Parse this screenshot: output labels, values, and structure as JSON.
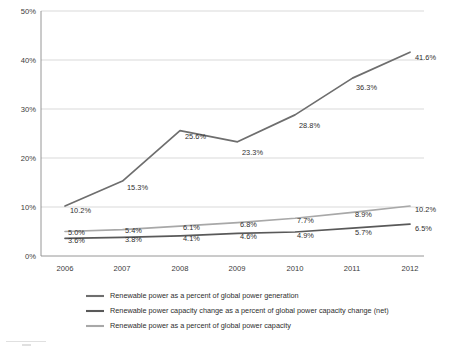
{
  "chart_data": {
    "type": "line",
    "title": "",
    "subtitle": "",
    "xlabel": "",
    "ylabel": "",
    "categories": [
      "2006",
      "2007",
      "2008",
      "2009",
      "2010",
      "2011",
      "2012"
    ],
    "ylim": [
      0,
      50
    ],
    "yticks": [
      0,
      10,
      20,
      30,
      40,
      50
    ],
    "ytick_labels": [
      "0%",
      "10%",
      "20%",
      "30%",
      "40%",
      "50%"
    ],
    "grid": true,
    "grid_axis": "y",
    "legend_position": "bottom",
    "series": [
      {
        "name": "Renewable power as a percent of global power generation",
        "key": "generation",
        "color": "#6e6e6e",
        "values": [
          10.2,
          15.3,
          25.6,
          23.3,
          28.8,
          36.3,
          41.6
        ],
        "labels": [
          "10.2%",
          "15.3%",
          "25.6%",
          "23.3%",
          "28.8%",
          "36.3%",
          "41.6%"
        ]
      },
      {
        "name": "Renewable power capacity change as a percent of global power capacity change (net)",
        "key": "capacity_change_net",
        "color": "#595959",
        "values": [
          3.6,
          3.8,
          4.1,
          4.6,
          4.9,
          5.7,
          6.5
        ],
        "labels": [
          "3.6%",
          "3.8%",
          "4.1%",
          "4.6%",
          "4.9%",
          "5.7%",
          "6.5%"
        ]
      },
      {
        "name": "Renewable power as a percent of global power capacity",
        "key": "capacity",
        "color": "#a8a8a8",
        "values": [
          5.0,
          5.4,
          6.1,
          6.8,
          7.7,
          8.9,
          10.2
        ],
        "labels": [
          "5.0%",
          "5.4%",
          "6.1%",
          "6.8%",
          "7.7%",
          "8.9%",
          "10.2%"
        ]
      }
    ],
    "legend": [
      {
        "label": "Renewable power as a percent of global power generation",
        "color": "#6e6e6e"
      },
      {
        "label": "Renewable power capacity change as a percent of global power capacity change (net)",
        "color": "#595959"
      },
      {
        "label": "Renewable power as a percent of global power capacity",
        "color": "#a8a8a8"
      }
    ],
    "colors": {
      "generation": "#6e6e6e",
      "capacity_change_net": "#595959",
      "capacity": "#a8a8a8",
      "grid": "#c8c8c8",
      "axis": "#8a8a8a",
      "text": "#2e2e2e",
      "background": "#ffffff"
    }
  }
}
